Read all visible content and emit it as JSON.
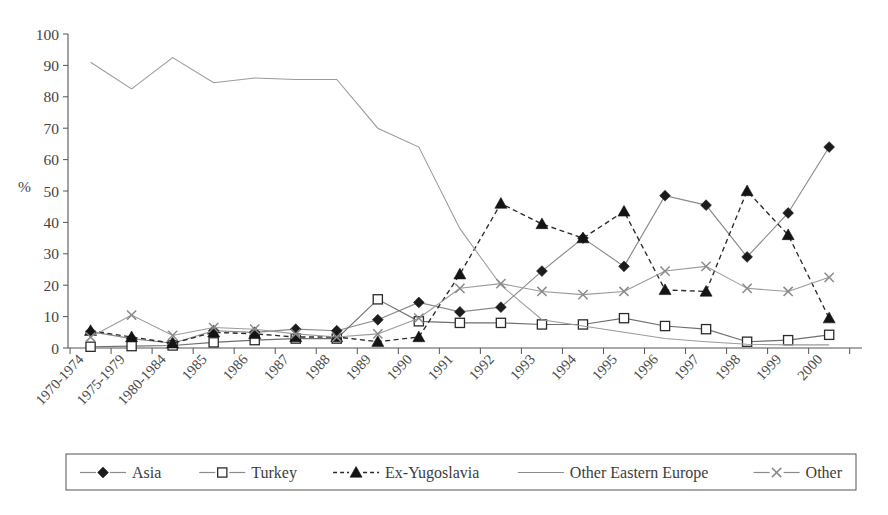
{
  "chart_data": {
    "type": "line",
    "title": "",
    "xlabel": "",
    "ylabel": "%",
    "ylim": [
      0,
      100
    ],
    "ytick_step": 10,
    "grid": false,
    "legend_position": "bottom",
    "categories": [
      "1970-1974",
      "1975-1979",
      "1980-1984",
      "1985",
      "1986",
      "1987",
      "1988",
      "1989",
      "1990",
      "1991",
      "1992",
      "1993",
      "1994",
      "1995",
      "1996",
      "1997",
      "1998",
      "1999",
      "2000"
    ],
    "yticks": [
      0,
      10,
      20,
      30,
      40,
      50,
      60,
      70,
      80,
      90,
      100
    ],
    "series": [
      {
        "name": "Asia",
        "marker": "diamond",
        "line_style": "solid",
        "values": [
          5.2,
          3.0,
          1.5,
          5.5,
          5.0,
          6.0,
          5.5,
          9.0,
          14.5,
          11.5,
          13.0,
          24.5,
          35.0,
          26.0,
          48.5,
          45.5,
          29.0,
          43.0,
          64.0
        ]
      },
      {
        "name": "Turkey",
        "marker": "open-square",
        "line_style": "solid",
        "values": [
          0.4,
          0.6,
          0.8,
          1.8,
          2.5,
          3.0,
          3.0,
          15.5,
          8.5,
          8.0,
          8.0,
          7.5,
          7.5,
          9.5,
          7.0,
          6.0,
          2.0,
          2.5,
          4.2
        ]
      },
      {
        "name": "Ex-Yugoslavia",
        "marker": "triangle",
        "line_style": "dashed",
        "values": [
          5.5,
          3.5,
          1.5,
          5.0,
          4.5,
          3.5,
          3.5,
          2.0,
          3.5,
          23.5,
          46.0,
          39.5,
          35.0,
          43.5,
          18.5,
          18.0,
          50.0,
          36.0,
          9.5
        ]
      },
      {
        "name": "Other Eastern Europe",
        "marker": "none",
        "line_style": "solid",
        "values": [
          91.0,
          82.5,
          92.5,
          84.5,
          86.0,
          85.5,
          85.5,
          70.0,
          64.0,
          38.0,
          20.0,
          9.0,
          7.0,
          5.0,
          3.0,
          2.0,
          1.2,
          1.0,
          1.0
        ]
      },
      {
        "name": "Other",
        "marker": "x",
        "line_style": "solid",
        "values": [
          3.5,
          10.5,
          4.0,
          6.5,
          6.0,
          4.5,
          3.5,
          4.5,
          9.5,
          19.0,
          20.5,
          18.0,
          17.0,
          18.0,
          24.5,
          26.0,
          19.0,
          18.0,
          22.5
        ]
      }
    ]
  },
  "legend": {
    "items": [
      {
        "label": "Asia",
        "marker": "diamond",
        "style": "solid"
      },
      {
        "label": "Turkey",
        "marker": "open-square",
        "style": "solid"
      },
      {
        "label": "Ex-Yugoslavia",
        "marker": "triangle",
        "style": "dashed"
      },
      {
        "label": "Other Eastern Europe",
        "marker": "none",
        "style": "solid"
      },
      {
        "label": "Other",
        "marker": "x",
        "style": "solid"
      }
    ]
  },
  "colors": {
    "axis": "#555555",
    "text": "#3d3d3d",
    "line_grey": "#8a8a8a",
    "marker_dark": "#1c1c1c",
    "background": "#ffffff"
  }
}
